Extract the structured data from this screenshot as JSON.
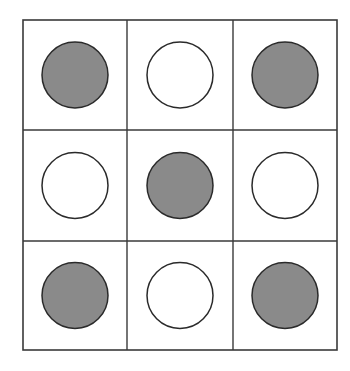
{
  "diagram": {
    "title": "",
    "rows": 3,
    "cols": 3,
    "cells": [
      [
        "filled",
        "empty",
        "filled"
      ],
      [
        "empty",
        "filled",
        "empty"
      ],
      [
        "filled",
        "empty",
        "filled"
      ]
    ],
    "colors": {
      "filled": "#8a8a8a",
      "empty": "#ffffff",
      "stroke": "#2a2a2a",
      "grid": "#3a3a3a"
    }
  }
}
